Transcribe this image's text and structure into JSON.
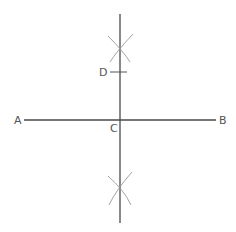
{
  "diagram": {
    "type": "geometric-construction",
    "colors": {
      "background": "#ffffff",
      "main_line": "#4a4a4a",
      "arc": "#9a9a9a",
      "label": "#555555"
    },
    "points": {
      "A": {
        "label": "A",
        "x": 24,
        "y": 120
      },
      "B": {
        "label": "B",
        "x": 216,
        "y": 120
      },
      "C": {
        "label": "C",
        "x": 120,
        "y": 120
      },
      "D": {
        "label": "D",
        "x": 120,
        "y": 72
      }
    },
    "segments": [
      {
        "name": "AB",
        "x1": 24,
        "y1": 120,
        "x2": 216,
        "y2": 120
      },
      {
        "name": "perpendicular-bisector",
        "x1": 120,
        "y1": 14,
        "x2": 120,
        "y2": 223
      }
    ],
    "arc_intersections": [
      {
        "name": "upper",
        "x": 120,
        "y": 48
      },
      {
        "name": "lower",
        "x": 120,
        "y": 192
      }
    ],
    "labels": {
      "A": "A",
      "B": "B",
      "C": "C",
      "D": "D"
    }
  }
}
